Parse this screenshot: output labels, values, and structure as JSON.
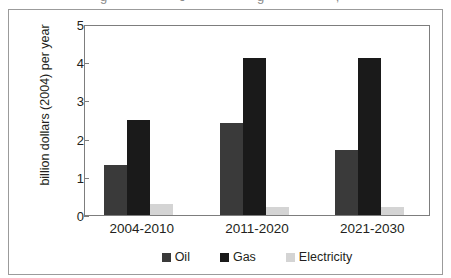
{
  "top_sliver": {
    "clipped_text": "g  c  g  ,"
  },
  "chart_data": {
    "type": "bar",
    "title": "",
    "subtitle": "",
    "xlabel": "",
    "ylabel": "billion dollars (2004) per year",
    "categories": [
      "2004-2010",
      "2011-2020",
      "2021-2030"
    ],
    "series": [
      {
        "name": "Oil",
        "color": "#3a3a3a",
        "values": [
          1.3,
          2.4,
          1.7
        ]
      },
      {
        "name": "Gas",
        "color": "#1a1a1a",
        "values": [
          2.5,
          4.1,
          4.1
        ]
      },
      {
        "name": "Electricity",
        "color": "#d4d4d4",
        "values": [
          0.3,
          0.2,
          0.2
        ]
      }
    ],
    "ylim": [
      0,
      5
    ],
    "yticks": [
      0,
      1,
      2,
      3,
      4,
      5
    ],
    "ytick_labels": [
      "0",
      "1",
      "2",
      "3",
      "4",
      "5"
    ],
    "grid": false,
    "legend_position": "bottom"
  },
  "axis": {
    "y_label_5": "5",
    "y_label_4": "4",
    "y_label_3": "3",
    "y_label_2": "2",
    "y_label_1": "1",
    "y_label_0": "0"
  },
  "legend": {
    "items": [
      {
        "label": "Oil"
      },
      {
        "label": "Gas"
      },
      {
        "label": "Electricity"
      }
    ]
  }
}
